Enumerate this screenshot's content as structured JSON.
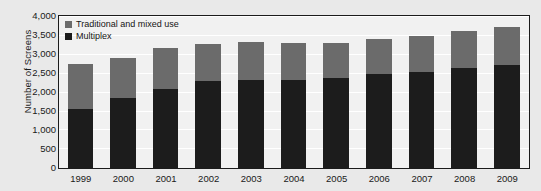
{
  "chart_data": {
    "type": "bar",
    "subtype": "stacked-vertical",
    "title": "",
    "xlabel": "",
    "ylabel": "Number of Screens",
    "ylim": [
      0,
      4000
    ],
    "ytick_step": 500,
    "grid": true,
    "legend_position": "top-left-inside",
    "categories": [
      "1999",
      "2000",
      "2001",
      "2002",
      "2003",
      "2004",
      "2005",
      "2006",
      "2007",
      "2008",
      "2009"
    ],
    "series": [
      {
        "name": "Multiplex",
        "color": "#1c1c1c",
        "values": [
          1550,
          1840,
          2080,
          2290,
          2340,
          2340,
          2370,
          2500,
          2550,
          2640,
          2720
        ]
      },
      {
        "name": "Traditional and mixed use",
        "color": "#6b6b6b",
        "values": [
          1190,
          1060,
          1100,
          1000,
          1000,
          970,
          940,
          920,
          950,
          990,
          1020
        ]
      }
    ],
    "totals": [
      2740,
      2900,
      3180,
      3290,
      3340,
      3310,
      3310,
      3420,
      3500,
      3630,
      3740
    ],
    "ytick_labels": [
      "4,000",
      "3,500",
      "3,000",
      "2,500",
      "2,000",
      "1,500",
      "1,000",
      "500",
      "0"
    ],
    "ytick_values": [
      4000,
      3500,
      3000,
      2500,
      2000,
      1500,
      1000,
      500,
      0
    ]
  },
  "legend": {
    "items": [
      {
        "label": "Traditional and mixed use",
        "color": "#6b6b6b"
      },
      {
        "label": "Multiplex",
        "color": "#1c1c1c"
      }
    ]
  },
  "axes": {
    "y_title": "Number of Screens"
  },
  "colors": {
    "plot_background": "#f1f1f1",
    "figure_background": "#e9e9e9",
    "axis_line": "#1b1b1b",
    "gridline": "#ffffff",
    "multiplex": "#1c1c1c",
    "traditional": "#6b6b6b"
  }
}
